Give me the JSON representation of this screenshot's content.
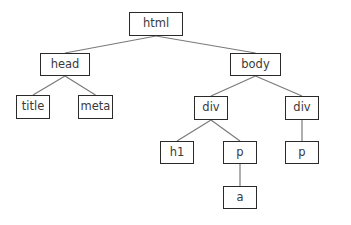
{
  "diagram": {
    "type": "tree",
    "line_color": "#7a7a7a",
    "border_color": "#2a2a2a",
    "nodes": [
      {
        "id": "html",
        "label": "html",
        "x": 129,
        "y": 12,
        "w": 54,
        "h": 24
      },
      {
        "id": "head",
        "label": "head",
        "x": 40,
        "y": 53,
        "w": 50,
        "h": 23
      },
      {
        "id": "body",
        "label": "body",
        "x": 230,
        "y": 53,
        "w": 51,
        "h": 23
      },
      {
        "id": "title",
        "label": "title",
        "x": 16,
        "y": 95,
        "w": 34,
        "h": 24
      },
      {
        "id": "meta",
        "label": "meta",
        "x": 78,
        "y": 95,
        "w": 35,
        "h": 24
      },
      {
        "id": "div1",
        "label": "div",
        "x": 194,
        "y": 96,
        "w": 34,
        "h": 24
      },
      {
        "id": "div2",
        "label": "div",
        "x": 285,
        "y": 96,
        "w": 34,
        "h": 24
      },
      {
        "id": "h1",
        "label": "h1",
        "x": 160,
        "y": 141,
        "w": 34,
        "h": 23
      },
      {
        "id": "p1",
        "label": "p",
        "x": 223,
        "y": 141,
        "w": 34,
        "h": 23
      },
      {
        "id": "p2",
        "label": "p",
        "x": 285,
        "y": 141,
        "w": 34,
        "h": 23
      },
      {
        "id": "a",
        "label": "a",
        "x": 223,
        "y": 186,
        "w": 34,
        "h": 23
      }
    ],
    "edges": [
      {
        "from": "html",
        "to": "head"
      },
      {
        "from": "html",
        "to": "body"
      },
      {
        "from": "head",
        "to": "title"
      },
      {
        "from": "head",
        "to": "meta"
      },
      {
        "from": "body",
        "to": "div1"
      },
      {
        "from": "body",
        "to": "div2"
      },
      {
        "from": "div1",
        "to": "h1"
      },
      {
        "from": "div1",
        "to": "p1"
      },
      {
        "from": "div2",
        "to": "p2"
      },
      {
        "from": "p1",
        "to": "a"
      }
    ]
  }
}
